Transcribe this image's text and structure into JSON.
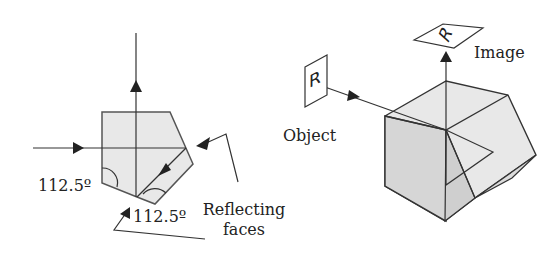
{
  "left_diagram": {
    "angle_label_1": "112.5º",
    "angle_label_2": "112.5º",
    "reflecting_faces_line1": "Reflecting",
    "reflecting_faces_line2": "faces"
  },
  "right_diagram": {
    "object_label": "Object",
    "image_label": "Image",
    "object_glyph": "R",
    "image_glyph": "R"
  },
  "colors": {
    "prism_fill": "#e6e6e6",
    "prism_dark_fill": "#d4d4d4",
    "stroke": "#333333"
  }
}
